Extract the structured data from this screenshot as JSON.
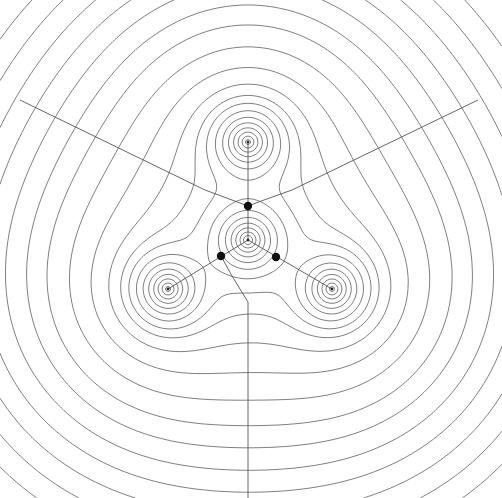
{
  "diagram": {
    "type": "electron density contour plot",
    "canvas": {
      "width": 502,
      "height": 498
    },
    "colors": {
      "background": "#ffffff",
      "contour": "#555555",
      "critical_point": "#111111",
      "nucleus": "#222222"
    },
    "nuclei": [
      {
        "id": "center",
        "x": 248,
        "y": 240,
        "weight": 1.15,
        "decay": 0.085
      },
      {
        "id": "top",
        "x": 248,
        "y": 142,
        "weight": 1.0,
        "decay": 0.085
      },
      {
        "id": "left",
        "x": 168,
        "y": 289,
        "weight": 1.0,
        "decay": 0.085
      },
      {
        "id": "right",
        "x": 332,
        "y": 289,
        "weight": 1.0,
        "decay": 0.085
      }
    ],
    "diffuse": {
      "weight": 0.08,
      "decay": 0.0175
    },
    "contour_levels": [
      0.0015,
      0.0022,
      0.0032,
      0.0046,
      0.0066,
      0.0095,
      0.0135,
      0.02,
      0.03,
      0.045,
      0.065,
      0.09,
      0.13,
      0.19,
      0.27,
      0.38,
      0.52,
      0.7,
      0.9
    ],
    "bond_critical_points": [
      {
        "id": "bcp-top",
        "x": 248,
        "y": 206,
        "r": 4.2
      },
      {
        "id": "bcp-left",
        "x": 221,
        "y": 256,
        "r": 4.2
      },
      {
        "id": "bcp-right",
        "x": 276,
        "y": 257,
        "r": 4.2
      }
    ],
    "bond_paths": [
      {
        "from": [
          248,
          240
        ],
        "to": [
          248,
          142
        ]
      },
      {
        "from": [
          248,
          240
        ],
        "to": [
          168,
          289
        ]
      },
      {
        "from": [
          248,
          240
        ],
        "to": [
          332,
          289
        ]
      }
    ],
    "interatomic_surfaces": [
      {
        "points": [
          [
            248,
            206
          ],
          [
            232,
            200
          ],
          [
            205,
            190
          ],
          [
            20,
            100
          ]
        ]
      },
      {
        "points": [
          [
            248,
            206
          ],
          [
            264,
            200
          ],
          [
            292,
            190
          ],
          [
            478,
            100
          ]
        ]
      },
      {
        "points": [
          [
            221,
            256
          ],
          [
            232,
            276
          ],
          [
            248,
            302
          ],
          [
            248,
            498
          ]
        ]
      }
    ]
  }
}
